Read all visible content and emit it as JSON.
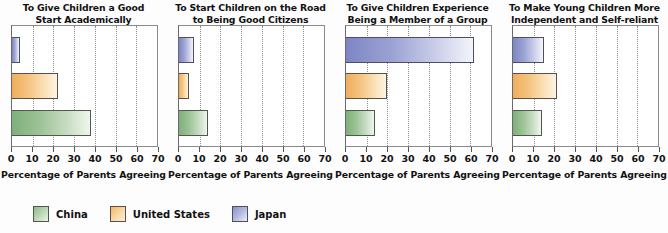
{
  "chart_data": [
    {
      "type": "bar",
      "orientation": "horizontal",
      "title": "To Give Children a Good Start Academically",
      "xlabel": "Percentage of Parents Agreeing",
      "ylabel": "",
      "xlim": [
        0,
        70
      ],
      "xticks": [
        0,
        10,
        20,
        30,
        40,
        50,
        60,
        70
      ],
      "grid": true,
      "legend_position": "bottom-left",
      "categories": [
        "Japan",
        "United States",
        "China"
      ],
      "values": [
        4,
        22,
        38
      ],
      "series": [
        {
          "name": "Japan",
          "values": [
            4
          ]
        },
        {
          "name": "United States",
          "values": [
            22
          ]
        },
        {
          "name": "China",
          "values": [
            38
          ]
        }
      ]
    },
    {
      "type": "bar",
      "orientation": "horizontal",
      "title": "To Start Children on the Road to Being Good Citizens",
      "xlabel": "Percentage of Parents Agreeing",
      "ylabel": "",
      "xlim": [
        0,
        70
      ],
      "xticks": [
        0,
        10,
        20,
        30,
        40,
        50,
        60,
        70
      ],
      "grid": true,
      "legend_position": "bottom-left",
      "categories": [
        "Japan",
        "United States",
        "China"
      ],
      "values": [
        7,
        5,
        14
      ],
      "series": [
        {
          "name": "Japan",
          "values": [
            7
          ]
        },
        {
          "name": "United States",
          "values": [
            5
          ]
        },
        {
          "name": "China",
          "values": [
            14
          ]
        }
      ]
    },
    {
      "type": "bar",
      "orientation": "horizontal",
      "title": "To Give Children Experience Being a Member of a Group",
      "xlabel": "Percentage of Parents Agreeing",
      "ylabel": "",
      "xlim": [
        0,
        70
      ],
      "xticks": [
        0,
        10,
        20,
        30,
        40,
        50,
        60,
        70
      ],
      "grid": true,
      "legend_position": "bottom-left",
      "categories": [
        "Japan",
        "United States",
        "China"
      ],
      "values": [
        62,
        20,
        14
      ],
      "series": [
        {
          "name": "Japan",
          "values": [
            62
          ]
        },
        {
          "name": "United States",
          "values": [
            20
          ]
        },
        {
          "name": "China",
          "values": [
            14
          ]
        }
      ]
    },
    {
      "type": "bar",
      "orientation": "horizontal",
      "title": "To Make Young Children More Independent and Self-reliant",
      "xlabel": "Percentage of Parents Agreeing",
      "ylabel": "",
      "xlim": [
        0,
        70
      ],
      "xticks": [
        0,
        10,
        20,
        30,
        40,
        50,
        60,
        70
      ],
      "grid": true,
      "legend_position": "bottom-left",
      "categories": [
        "Japan",
        "United States",
        "China"
      ],
      "values": [
        15,
        21,
        14
      ],
      "series": [
        {
          "name": "Japan",
          "values": [
            15
          ]
        },
        {
          "name": "United States",
          "values": [
            21
          ]
        },
        {
          "name": "China",
          "values": [
            14
          ]
        }
      ]
    }
  ],
  "panels": [
    {
      "title_line1": "To Give Children a Good",
      "title_line2": "Start Academically",
      "axis_title": "Percentage of Parents Agreeing",
      "bars": [
        {
          "series": "Japan",
          "value": 4
        },
        {
          "series": "United States",
          "value": 22
        },
        {
          "series": "China",
          "value": 38
        }
      ]
    },
    {
      "title_line1": "To Start Children on the Road",
      "title_line2": "to Being Good Citizens",
      "axis_title": "Percentage of Parents Agreeing",
      "bars": [
        {
          "series": "Japan",
          "value": 7
        },
        {
          "series": "United States",
          "value": 5
        },
        {
          "series": "China",
          "value": 14
        }
      ]
    },
    {
      "title_line1": "To Give Children Experience",
      "title_line2": "Being a Member of a Group",
      "axis_title": "Percentage of Parents Agreeing",
      "bars": [
        {
          "series": "Japan",
          "value": 62
        },
        {
          "series": "United States",
          "value": 20
        },
        {
          "series": "China",
          "value": 14
        }
      ]
    },
    {
      "title_line1": "To Make Young Children More",
      "title_line2": "Independent and Self-reliant",
      "axis_title": "Percentage of Parents Agreeing",
      "bars": [
        {
          "series": "Japan",
          "value": 15
        },
        {
          "series": "United States",
          "value": 21
        },
        {
          "series": "China",
          "value": 14
        }
      ]
    }
  ],
  "axis": {
    "ticks": [
      "0",
      "10",
      "20",
      "30",
      "40",
      "50",
      "60",
      "70"
    ],
    "min": 0,
    "max": 70
  },
  "legend": {
    "items": [
      {
        "label": "China",
        "key": "china",
        "color": "#9cc296"
      },
      {
        "label": "United States",
        "key": "us",
        "color": "#f5c37f"
      },
      {
        "label": "Japan",
        "key": "japan",
        "color": "#9aa1d2"
      }
    ]
  },
  "colors": {
    "china": "#9cc296",
    "united_states": "#f5c37f",
    "japan": "#9aa1d2",
    "grid": "#8f8f8f",
    "axis": "#555555",
    "text": "#111111",
    "background": "#fdfdfd"
  }
}
